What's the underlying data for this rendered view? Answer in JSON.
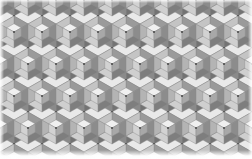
{
  "image": {
    "title": "Isometric Cube Tessellation",
    "kind": "seamless-geometric-pattern",
    "width": 252,
    "height": 159,
    "background": "#ffffff"
  },
  "pattern": {
    "name": "isometric-cube-hexagon-tiling",
    "motif": "3d-cube-in-hexagon",
    "lattice": "staggered-hexagonal",
    "cell_width": 28,
    "cell_height": 32,
    "row_offset_x": 14,
    "columns": 10,
    "rows": 6,
    "stroke_color": "#8e8e8e",
    "stroke_width": 0.45,
    "center_dot_color": "#3d3d3d",
    "center_dot_radius": 0.9
  },
  "palette": {
    "cube_top": "#f0f0f0",
    "cube_left": "#d2d2d2",
    "cube_right": "#a8a8a8",
    "ring_top_left": "#c4c4c4",
    "ring_top_right": "#9a9a9a",
    "ring_left": "#b4b4b4",
    "ring_right": "#8c8c8c",
    "ring_bottom_left": "#cfcfcf",
    "ring_bottom_right": "#7e7e7e",
    "star_dark": "#737373",
    "star_darker": "#636363",
    "star_mid": "#8a8a8a",
    "gap_light": "#e4e4e4",
    "gap_pale": "#ededed",
    "outline": "#8e8e8e"
  },
  "tones": {
    "lightest": "#f4f4f4",
    "light": "#e0e0e0",
    "mid_light": "#c8c8c8",
    "mid": "#aaaaaa",
    "mid_dark": "#8d8d8d",
    "dark": "#6f6f6f",
    "darkest": "#585858"
  },
  "edges": {
    "left_margin_label": "white-margin-left",
    "right_margin_label": "white-margin-right",
    "top_margin_label": "white-margin-top",
    "bottom_margin_label": "white-margin-bottom"
  }
}
